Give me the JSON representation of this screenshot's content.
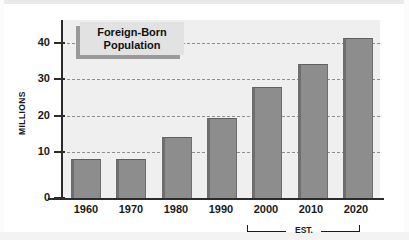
{
  "chart_data": {
    "type": "bar",
    "title": "Foreign-Born Population",
    "title_line1": "Foreign-Born",
    "title_line2": "Population",
    "xlabel": "",
    "ylabel": "MILLIONS",
    "categories": [
      "1960",
      "1970",
      "1980",
      "1990",
      "2000",
      "2010",
      "2020"
    ],
    "values": [
      9.7,
      9.7,
      15.0,
      19.8,
      27.4,
      33.2,
      39.5
    ],
    "ylim": [
      0,
      44
    ],
    "yticks": [
      0,
      10,
      20,
      30,
      40
    ],
    "ytick_labels": [
      "0",
      "10",
      "20",
      "30",
      "40"
    ],
    "grid": true,
    "gridline_values": [
      10,
      20,
      30,
      40
    ],
    "legend": "none",
    "annotations": [
      {
        "text": "EST.",
        "label": "EST.",
        "covers_categories": [
          "2000",
          "2010",
          "2020"
        ],
        "description": "Bracket beneath 2000 through 2020 marking estimated values"
      }
    ],
    "colors": {
      "bar_fill": "#8d8d8d",
      "bar_edge": "#6e6e6e",
      "plot_background": "#efefef",
      "figure_background": "#ffffff",
      "axis": "#2b2b2b",
      "gridline": "#8e8e8e",
      "title_box_background": "#e2e2e2",
      "title_box_shadow": "#9a9a9a",
      "text": "#1a1a1a"
    }
  }
}
